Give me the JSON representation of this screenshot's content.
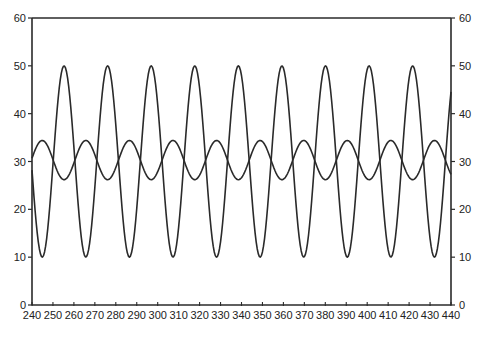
{
  "chart_data": {
    "type": "line",
    "title": "",
    "xlabel": "",
    "ylabel": "",
    "xlim": [
      240,
      440
    ],
    "ylim": [
      0,
      60
    ],
    "x_ticks": [
      240,
      250,
      260,
      270,
      280,
      290,
      300,
      310,
      320,
      330,
      340,
      350,
      360,
      370,
      380,
      390,
      400,
      410,
      420,
      430,
      440
    ],
    "y_ticks_left": [
      0,
      10,
      20,
      30,
      40,
      50,
      60
    ],
    "y_ticks_right": [
      0,
      10,
      20,
      30,
      40,
      50,
      60
    ],
    "grid": false,
    "legend": null,
    "line_color": "#2a2a2a",
    "series": [
      {
        "name": "large-amplitude wave",
        "description": "sinusoid centered at 30, range ~10 to ~50, period ~20.8, peaks near 255, 276, 297, 318, 339, 360, 380, 401, 422",
        "center": 30,
        "amplitude": 20,
        "period": 20.8,
        "phase_peak_x": 255.3,
        "x": [
          240,
          245,
          250,
          255,
          260,
          265,
          270,
          275,
          280,
          285,
          290,
          295,
          300,
          305,
          310,
          315,
          320,
          325,
          330,
          335,
          340,
          345,
          350,
          355,
          360,
          365,
          370,
          375,
          380,
          385,
          390,
          395,
          400,
          405,
          410,
          415,
          420,
          425,
          430,
          435,
          440
        ],
        "values": [
          27.2,
          10.1,
          24.5,
          49.9,
          28.1,
          10.3,
          31.8,
          49.4,
          22.0,
          11.6,
          38.7,
          46.5,
          16.7,
          15.5,
          43.9,
          42.2,
          12.7,
          20.3,
          47.7,
          36.3,
          10.4,
          26.3,
          49.7,
          29.6,
          10.6,
          33.4,
          49.0,
          20.5,
          12.2,
          40.3,
          45.4,
          15.7,
          16.6,
          45.0,
          40.7,
          12.2,
          21.9,
          48.3,
          34.7,
          10.2,
          27.8
        ]
      },
      {
        "name": "small-amplitude wave",
        "description": "sinusoid centered at ~30.3, range ~26.2 to ~34.4, same period, in antiphase with large wave",
        "center": 30.3,
        "amplitude": 4.1,
        "period": 20.8,
        "phase_trough_x": 255.3,
        "x": [
          240,
          245,
          250,
          255,
          260,
          265,
          270,
          275,
          280,
          285,
          290,
          295,
          300,
          305,
          310,
          315,
          320,
          325,
          330,
          335,
          340,
          345,
          350,
          355,
          360,
          365,
          370,
          375,
          380,
          385,
          390,
          395,
          400,
          405,
          410,
          415,
          420,
          425,
          430,
          435,
          440
        ],
        "values": [
          30.9,
          34.4,
          31.4,
          26.2,
          30.7,
          34.3,
          29.9,
          26.3,
          32.0,
          34.1,
          28.5,
          26.9,
          33.0,
          33.2,
          27.5,
          27.7,
          33.8,
          32.2,
          26.8,
          28.9,
          34.4,
          31.0,
          26.3,
          30.4,
          34.3,
          30.0,
          26.4,
          32.1,
          33.9,
          28.8,
          27.1,
          33.3,
          33.1,
          27.3,
          28.5,
          33.9,
          31.7,
          26.6,
          29.4,
          34.4,
          30.8
        ]
      }
    ]
  }
}
